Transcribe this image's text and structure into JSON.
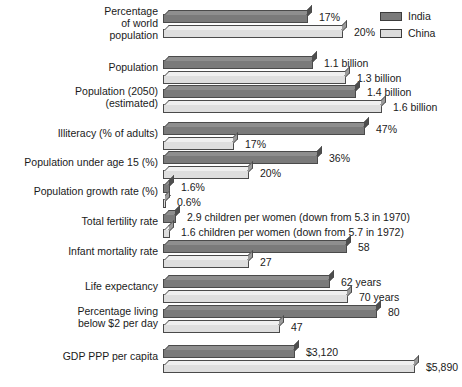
{
  "legend": {
    "position": "top-right",
    "entries": [
      {
        "label": "India",
        "color": "#7a7a7a",
        "key": "india"
      },
      {
        "label": "China",
        "color": "#dedede",
        "key": "china"
      }
    ]
  },
  "chart_data": {
    "type": "bar",
    "orientation": "horizontal",
    "title": "",
    "subtitle": "",
    "xlabel": "",
    "ylabel": "",
    "grid": false,
    "legend_position": "top-right",
    "series": [
      {
        "name": "India",
        "color": "#7a7a7a"
      },
      {
        "name": "China",
        "color": "#dedede"
      }
    ],
    "categories": [
      "Percentage of world population",
      "Population",
      "Population (2050) (estimated)",
      "Illiteracy (% of adults)",
      "Population under age 15 (%)",
      "Population growth rate (%)",
      "Total fertility rate",
      "Infant mortality rate",
      "Life expectancy",
      "Percentage living below $2 per day",
      "GDP PPP per capita"
    ],
    "rows": [
      {
        "label_lines": [
          "Percentage",
          "of world",
          "population"
        ],
        "india": {
          "value": 17,
          "display": "17%",
          "bar_px": 145
        },
        "china": {
          "value": 20,
          "display": "20%",
          "bar_px": 180
        }
      },
      {
        "label_lines": [
          "Population"
        ],
        "india": {
          "value": 1.1,
          "display": "1.1 billion",
          "bar_px": 150
        },
        "china": {
          "value": 1.3,
          "display": "1.3 billion",
          "bar_px": 183
        }
      },
      {
        "label_lines": [
          "Population (2050)",
          "(estimated)"
        ],
        "india": {
          "value": 1.4,
          "display": "1.4 billion",
          "bar_px": 193
        },
        "china": {
          "value": 1.6,
          "display": "1.6 billion",
          "bar_px": 219
        }
      },
      {
        "label_lines": [
          "Illiteracy (% of adults)"
        ],
        "india": {
          "value": 47,
          "display": "47%",
          "bar_px": 202
        },
        "china": {
          "value": 17,
          "display": "17%",
          "bar_px": 71
        }
      },
      {
        "label_lines": [
          "Population under age 15 (%)"
        ],
        "india": {
          "value": 36,
          "display": "36%",
          "bar_px": 155
        },
        "china": {
          "value": 20,
          "display": "20%",
          "bar_px": 86
        }
      },
      {
        "label_lines": [
          "Population growth rate (%)"
        ],
        "india": {
          "value": 1.6,
          "display": "1.6%",
          "bar_px": 7
        },
        "china": {
          "value": 0.6,
          "display": "0.6%",
          "bar_px": 3
        }
      },
      {
        "label_lines": [
          "Total fertility rate"
        ],
        "india": {
          "value": 2.9,
          "display": "2.9 children per women (down from 5.3 in 1970)",
          "bar_px": 13
        },
        "china": {
          "value": 1.6,
          "display": "1.6 children per women (down from 5.7 in 1972)",
          "bar_px": 7
        }
      },
      {
        "label_lines": [
          "Infant mortality rate"
        ],
        "india": {
          "value": 58,
          "display": "58",
          "bar_px": 184
        },
        "china": {
          "value": 27,
          "display": "27",
          "bar_px": 86
        }
      },
      {
        "label_lines": [
          "Life expectancy"
        ],
        "india": {
          "value": 62,
          "display": "62 years",
          "bar_px": 167
        },
        "china": {
          "value": 70,
          "display": "70 years",
          "bar_px": 185
        }
      },
      {
        "label_lines": [
          "Percentage living",
          "below $2 per day"
        ],
        "india": {
          "value": 80,
          "display": "80",
          "bar_px": 214
        },
        "china": {
          "value": 47,
          "display": "47",
          "bar_px": 117
        }
      },
      {
        "label_lines": [
          "GDP PPP per capita"
        ],
        "india": {
          "value": 3120,
          "display": "$3,120",
          "bar_px": 132
        },
        "china": {
          "value": 5890,
          "display": "$5,890",
          "bar_px": 252
        }
      }
    ]
  }
}
